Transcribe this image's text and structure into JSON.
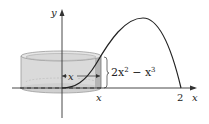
{
  "diagram": {
    "type": "cylindrical-shell",
    "axes": {
      "x_label": "x",
      "y_label": "y"
    },
    "tick_labels": {
      "x_position": "x",
      "x_end": "2"
    },
    "labels": {
      "radius": "x",
      "height_expr_base": "2x",
      "height_expr_exp1": "2",
      "height_expr_minus": " − x",
      "height_expr_exp2": "3"
    },
    "curve": {
      "equation": "y = 2x^2 - x^3",
      "domain": [
        0,
        2
      ]
    },
    "colors": {
      "shell_fill": "#d4d4d4",
      "shell_stroke": "#9a9a9a",
      "curve": "#222222",
      "axis": "#333333"
    }
  }
}
